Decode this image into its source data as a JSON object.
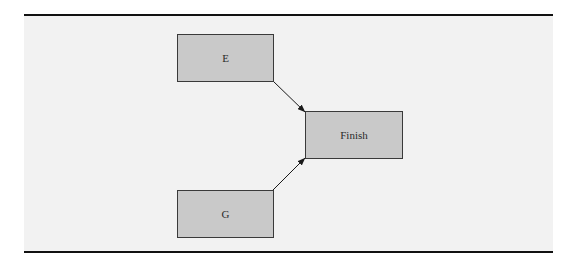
{
  "diagram": {
    "type": "network-diagram",
    "nodes": [
      {
        "id": "E",
        "label": "E"
      },
      {
        "id": "G",
        "label": "G"
      },
      {
        "id": "Finish",
        "label": "Finish"
      }
    ],
    "edges": [
      {
        "from": "E",
        "to": "Finish"
      },
      {
        "from": "G",
        "to": "Finish"
      }
    ],
    "colors": {
      "node_fill": "#c9c9c9",
      "node_border": "#3a3a3a",
      "background": "#f2f2f2",
      "rule": "#111111"
    }
  }
}
